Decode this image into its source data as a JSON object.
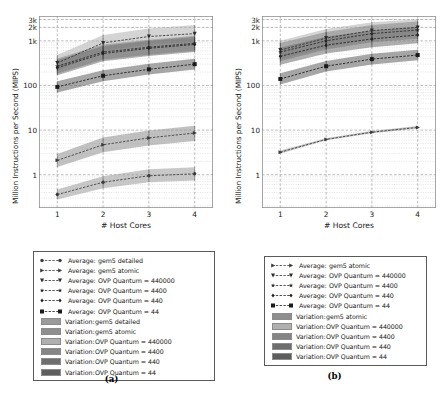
{
  "figure": {
    "width": 446,
    "height": 398,
    "background": "#ffffff"
  },
  "panels": [
    {
      "id": "a",
      "subcaption": "(a)",
      "chart_data": {
        "type": "line",
        "title": "",
        "xlabel": "# Host Cores",
        "ylabel": "Million Instructions per Second (MIPS)",
        "xscale": "linear",
        "yscale": "log",
        "xlim": [
          0.6,
          4.4
        ],
        "ylim": [
          0.18,
          3600
        ],
        "xticks": [
          1,
          2,
          3,
          4
        ],
        "xticklabels": [
          "1",
          "2",
          "3",
          "4"
        ],
        "yticks": [
          1,
          10,
          100,
          1000,
          2000,
          3000
        ],
        "yticklabels": [
          "1",
          "10",
          "100",
          "1k",
          "2k",
          "3k"
        ],
        "grid": true,
        "legend_position": "below",
        "x": [
          1,
          2,
          3,
          4
        ],
        "series": [
          {
            "name": "Average: gem5 detailed",
            "marker": "circle",
            "linestyle": "dashed",
            "color": "#3c3c3c",
            "values": [
              0.36,
              0.68,
              0.95,
              1.05
            ],
            "band_low": [
              0.28,
              0.5,
              0.68,
              0.74
            ],
            "band_high": [
              0.47,
              0.92,
              1.32,
              1.48
            ],
            "band_color": "#9a9a9a"
          },
          {
            "name": "Average: gem5 atomic",
            "marker": "arrow-right",
            "linestyle": "dashed",
            "color": "#3a3a3a",
            "values": [
              2.1,
              4.7,
              6.7,
              8.6
            ],
            "band_low": [
              1.5,
              3.2,
              4.5,
              5.7
            ],
            "band_high": [
              2.9,
              6.8,
              9.8,
              12.6
            ],
            "band_color": "#8e8e8e"
          },
          {
            "name": "Average: OVP Quantum = 440000",
            "marker": "triangle-down",
            "linestyle": "dashed",
            "color": "#2e2e2e",
            "values": [
              320,
              900,
              1250,
              1450
            ],
            "band_low": [
              210,
              600,
              830,
              950
            ],
            "band_high": [
              480,
              1350,
              1900,
              2250
            ],
            "band_color": "#b0b0b0"
          },
          {
            "name": "Average: OVP Quantum = 4400",
            "marker": "star",
            "linestyle": "dashed",
            "color": "#282828",
            "values": [
              270,
              560,
              720,
              880
            ],
            "band_low": [
              185,
              380,
              490,
              600
            ],
            "band_high": [
              400,
              830,
              1060,
              1300
            ],
            "band_color": "#858585"
          },
          {
            "name": "Average: OVP Quantum = 440",
            "marker": "diamond",
            "linestyle": "dashed",
            "color": "#222222",
            "values": [
              250,
              520,
              680,
              830
            ],
            "band_low": [
              170,
              350,
              460,
              560
            ],
            "band_high": [
              370,
              770,
              1000,
              1220
            ],
            "band_color": "#6e6e6e"
          },
          {
            "name": "Average: OVP Quantum = 44",
            "marker": "square",
            "linestyle": "dashed",
            "color": "#1a1a1a",
            "values": [
              93,
              165,
              230,
              300
            ],
            "band_low": [
              70,
              125,
              175,
              228
            ],
            "band_high": [
              124,
              220,
              305,
              395
            ],
            "band_color": "#5e5e5e"
          }
        ],
        "legend": [
          {
            "kind": "line",
            "marker": "circle",
            "label_prefix": "Average:",
            "label": "gem5 detailed",
            "color": "#3c3c3c"
          },
          {
            "kind": "line",
            "marker": "arrow-right",
            "label_prefix": "Average:",
            "label": "gem5 atomic",
            "color": "#3a3a3a"
          },
          {
            "kind": "line",
            "marker": "triangle-down",
            "label_prefix": "Average:",
            "label": "OVP Quantum = 440000",
            "color": "#2e2e2e"
          },
          {
            "kind": "line",
            "marker": "star",
            "label_prefix": "Average:",
            "label": "OVP Quantum = 4400",
            "color": "#282828"
          },
          {
            "kind": "line",
            "marker": "diamond",
            "label_prefix": "Average:",
            "label": "OVP Quantum = 440",
            "color": "#222222"
          },
          {
            "kind": "line",
            "marker": "square",
            "label_prefix": "Average:",
            "label": "OVP Quantum = 44",
            "color": "#1a1a1a"
          },
          {
            "kind": "patch",
            "label_prefix": "Variation:",
            "label": "gem5 detailed",
            "color": "#9a9a9a"
          },
          {
            "kind": "patch",
            "label_prefix": "Variation:",
            "label": "gem5 atomic",
            "color": "#8e8e8e"
          },
          {
            "kind": "patch",
            "label_prefix": "Variation:",
            "label": "OVP Quantum = 440000",
            "color": "#b0b0b0"
          },
          {
            "kind": "patch",
            "label_prefix": "Variation:",
            "label": "OVP Quantum = 4400",
            "color": "#858585"
          },
          {
            "kind": "patch",
            "label_prefix": "Variation:",
            "label": "OVP Quantum = 440",
            "color": "#6e6e6e"
          },
          {
            "kind": "patch",
            "label_prefix": "Variation:",
            "label": "OVP Quantum = 44",
            "color": "#5e5e5e"
          }
        ]
      }
    },
    {
      "id": "b",
      "subcaption": "(b)",
      "chart_data": {
        "type": "line",
        "title": "",
        "xlabel": "# Host Cores",
        "ylabel": "Million Instructions per Second (MIPS)",
        "xscale": "linear",
        "yscale": "log",
        "xlim": [
          0.6,
          4.4
        ],
        "ylim": [
          0.18,
          3600
        ],
        "xticks": [
          1,
          2,
          3,
          4
        ],
        "xticklabels": [
          "1",
          "2",
          "3",
          "4"
        ],
        "yticks": [
          1,
          10,
          100,
          1000,
          2000,
          3000
        ],
        "yticklabels": [
          "1",
          "10",
          "100",
          "1k",
          "2k",
          "3k"
        ],
        "grid": true,
        "legend_position": "below",
        "x": [
          1,
          2,
          3,
          4
        ],
        "series": [
          {
            "name": "Average: gem5 atomic",
            "marker": "arrow-right",
            "linestyle": "dashed",
            "color": "#3a3a3a",
            "values": [
              3.2,
              6.2,
              9.0,
              11.5
            ],
            "band_low": [
              3.0,
              5.9,
              8.5,
              10.8
            ],
            "band_high": [
              3.5,
              6.6,
              9.6,
              12.3
            ],
            "band_color": "#8e8e8e"
          },
          {
            "name": "Average: OVP Quantum = 440000",
            "marker": "triangle-down",
            "linestyle": "dashed",
            "color": "#2e2e2e",
            "values": [
              620,
              1150,
              1700,
              2000
            ],
            "band_low": [
              380,
              720,
              1080,
              1300
            ],
            "band_high": [
              1000,
              1850,
              2600,
              3050
            ],
            "band_color": "#b0b0b0"
          },
          {
            "name": "Average: OVP Quantum = 4400",
            "marker": "star",
            "linestyle": "dashed",
            "color": "#282828",
            "values": [
              560,
              1000,
              1450,
              1750
            ],
            "band_low": [
              350,
              640,
              930,
              1120
            ],
            "band_high": [
              890,
              1580,
              2250,
              2700
            ],
            "band_color": "#858585"
          },
          {
            "name": "Average: OVP Quantum = 440",
            "marker": "diamond",
            "linestyle": "dashed",
            "color": "#222222",
            "values": [
              450,
              800,
              1100,
              1350
            ],
            "band_low": [
              290,
              520,
              720,
              880
            ],
            "band_high": [
              700,
              1230,
              1700,
              2080
            ],
            "band_color": "#6e6e6e"
          },
          {
            "name": "Average: OVP Quantum = 44",
            "marker": "square",
            "linestyle": "dashed",
            "color": "#1a1a1a",
            "values": [
              140,
              270,
              390,
              480
            ],
            "band_low": [
              105,
              205,
              295,
              365
            ],
            "band_high": [
              187,
              355,
              515,
              630
            ],
            "band_color": "#5e5e5e"
          }
        ],
        "legend": [
          {
            "kind": "line",
            "marker": "arrow-right",
            "label_prefix": "Average:",
            "label": "gem5 atomic",
            "color": "#3a3a3a"
          },
          {
            "kind": "line",
            "marker": "triangle-down",
            "label_prefix": "Average:",
            "label": "OVP Quantum = 440000",
            "color": "#2e2e2e"
          },
          {
            "kind": "line",
            "marker": "star",
            "label_prefix": "Average:",
            "label": "OVP Quantum = 4400",
            "color": "#282828"
          },
          {
            "kind": "line",
            "marker": "diamond",
            "label_prefix": "Average:",
            "label": "OVP Quantum = 440",
            "color": "#222222"
          },
          {
            "kind": "line",
            "marker": "square",
            "label_prefix": "Average:",
            "label": "OVP Quantum = 44",
            "color": "#1a1a1a"
          },
          {
            "kind": "patch",
            "label_prefix": "Variation:",
            "label": "gem5 atomic",
            "color": "#8e8e8e"
          },
          {
            "kind": "patch",
            "label_prefix": "Variation:",
            "label": "OVP Quantum = 440000",
            "color": "#b0b0b0"
          },
          {
            "kind": "patch",
            "label_prefix": "Variation:",
            "label": "OVP Quantum = 4400",
            "color": "#858585"
          },
          {
            "kind": "patch",
            "label_prefix": "Variation:",
            "label": "OVP Quantum = 440",
            "color": "#6e6e6e"
          },
          {
            "kind": "patch",
            "label_prefix": "Variation:",
            "label": "OVP Quantum = 44",
            "color": "#5e5e5e"
          }
        ]
      }
    }
  ]
}
